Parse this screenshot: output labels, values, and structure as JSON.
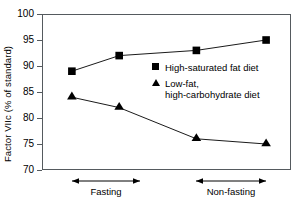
{
  "chart_data": {
    "type": "line",
    "title": "",
    "xlabel": "",
    "ylabel": "Factor VIIc (% of standard)",
    "ylim": [
      70,
      100
    ],
    "yticks": [
      70,
      75,
      80,
      85,
      90,
      95,
      100
    ],
    "grid": false,
    "legend_position": "inside-right",
    "x": [
      1,
      2,
      3,
      4
    ],
    "x_pixel_fractions": [
      0.12,
      0.31,
      0.62,
      0.9
    ],
    "series": [
      {
        "name": "High-saturated fat diet",
        "marker": "square",
        "color": "#000000",
        "values": [
          89,
          92,
          93,
          95
        ]
      },
      {
        "name": "Low-fat, high-carbohydrate diet",
        "marker": "triangle",
        "color": "#000000",
        "values": [
          84,
          82,
          76,
          75
        ]
      }
    ],
    "annotations": [
      {
        "label": "Fasting",
        "span_from": 1,
        "span_to": 2,
        "style": "double-headed-arrow"
      },
      {
        "label": "Non-fasting",
        "span_from": 3,
        "span_to": 4,
        "style": "double-headed-arrow"
      }
    ]
  },
  "legend": {
    "entries": [
      {
        "label": "High-saturated fat diet",
        "marker": "square"
      },
      {
        "label": "Low-fat,\nhigh-carbohydrate diet",
        "marker": "triangle"
      }
    ]
  },
  "axis": {
    "y_tick_labels": [
      "100",
      "95",
      "90",
      "85",
      "80",
      "75",
      "70"
    ],
    "y_title": "Factor VIIc (% of standard)"
  },
  "annotations": {
    "fasting_label": "Fasting",
    "nonfasting_label": "Non-fasting"
  }
}
